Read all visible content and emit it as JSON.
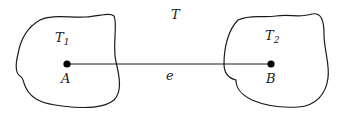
{
  "diagram": {
    "graph_label": "T",
    "edge_label": "e",
    "left_region": {
      "label": "T",
      "subscript": "1",
      "vertex": "A"
    },
    "right_region": {
      "label": "T",
      "subscript": "2",
      "vertex": "B"
    },
    "colors": {
      "stroke": "#1a1a1a",
      "background": "#ffffff"
    }
  }
}
